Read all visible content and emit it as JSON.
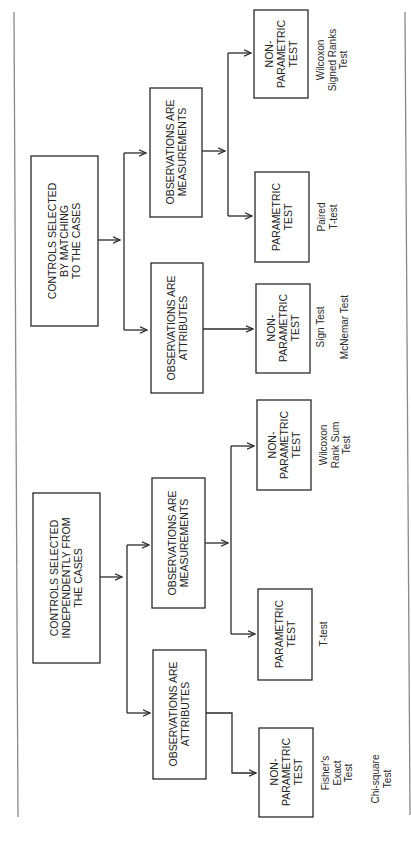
{
  "diagram": {
    "orientation": "rotated-90-ccw",
    "branches": [
      {
        "id": "matching",
        "root": {
          "lines": [
            "CONTROLS SELECTED",
            "BY MATCHING",
            "TO THE CASES"
          ]
        },
        "children": [
          {
            "id": "matching-attributes",
            "label": {
              "lines": [
                "OBSERVATIONS ARE",
                "ATTRIBUTES"
              ]
            },
            "tests": [
              {
                "label": {
                  "lines": [
                    "NON-",
                    "PARAMETRIC",
                    "TEST"
                  ]
                },
                "results": [
                  "Sign Test",
                  "McNemar Test"
                ]
              }
            ]
          },
          {
            "id": "matching-measurements",
            "label": {
              "lines": [
                "OBSERVATIONS ARE",
                "MEASUREMENTS"
              ]
            },
            "tests": [
              {
                "label": {
                  "lines": [
                    "PARAMETRIC",
                    "TEST"
                  ]
                },
                "results": [
                  "Paired",
                  "T-test"
                ]
              },
              {
                "label": {
                  "lines": [
                    "NON-",
                    "PARAMETRIC",
                    "TEST"
                  ]
                },
                "results": [
                  "Wilcoxon",
                  "Signed Ranks",
                  "Test"
                ]
              }
            ]
          }
        ]
      },
      {
        "id": "independent",
        "root": {
          "lines": [
            "CONTROLS SELECTED",
            "INDEPENDENTLY FROM",
            "THE CASES"
          ]
        },
        "children": [
          {
            "id": "independent-attributes",
            "label": {
              "lines": [
                "OBSERVATIONS ARE",
                "ATTRIBUTES"
              ]
            },
            "tests": [
              {
                "label": {
                  "lines": [
                    "NON-",
                    "PARAMETRIC",
                    "TEST"
                  ]
                },
                "results": [
                  "Fisher's",
                  "Exact",
                  "Test"
                ],
                "results2": [
                  "Chi-square",
                  "Test"
                ]
              }
            ]
          },
          {
            "id": "independent-measurements",
            "label": {
              "lines": [
                "OBSERVATIONS ARE",
                "MEASUREMENTS"
              ]
            },
            "tests": [
              {
                "label": {
                  "lines": [
                    "PARAMETRIC",
                    "TEST"
                  ]
                },
                "results": [
                  "T-test"
                ]
              },
              {
                "label": {
                  "lines": [
                    "NON-",
                    "PARAMETRIC",
                    "TEST"
                  ]
                },
                "results": [
                  "Wilcoxon",
                  "Rank Sum",
                  "Test"
                ]
              }
            ]
          }
        ]
      }
    ],
    "colors": {
      "box_stroke": "#2a2a2a",
      "frame": "#8a8a8a",
      "background": "#ffffff"
    }
  }
}
